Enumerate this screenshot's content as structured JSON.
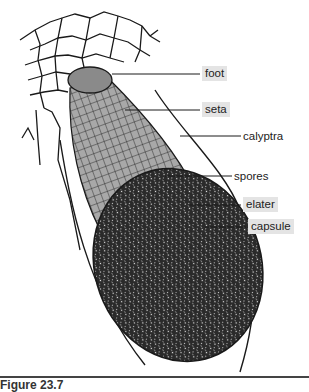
{
  "figure": {
    "caption": "Figure 23.7",
    "colors": {
      "seta_fill": "#a8a8a8",
      "capsule_fill": "#2a2a2a",
      "label_box": "#e4e4e4",
      "line": "#1a1a1a"
    }
  },
  "labels": [
    {
      "id": "foot",
      "text": "foot",
      "boxed": true
    },
    {
      "id": "seta",
      "text": "seta",
      "boxed": true
    },
    {
      "id": "calyptra",
      "text": "calyptra",
      "boxed": false
    },
    {
      "id": "spores",
      "text": "spores",
      "boxed": false
    },
    {
      "id": "elater",
      "text": "elater",
      "boxed": true
    },
    {
      "id": "capsule",
      "text": "capsule",
      "boxed": true
    }
  ]
}
